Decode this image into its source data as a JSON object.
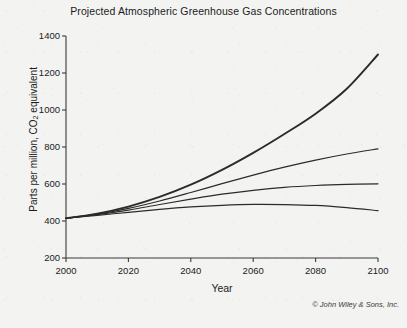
{
  "chart_data": {
    "type": "line",
    "title": "Projected Atmospheric Greenhouse Gas Concentrations",
    "xlabel": "Year",
    "ylabel": "Parts per million, CO2 equivalent",
    "ylabel_prefix": "Parts per million, CO",
    "ylabel_subscript": "2",
    "ylabel_suffix": " equivalent",
    "xlim": [
      2000,
      2100
    ],
    "ylim": [
      200,
      1400
    ],
    "xticks": [
      2000,
      2020,
      2040,
      2060,
      2080,
      2100
    ],
    "xtick_labels": [
      "2000",
      "2020",
      "2040",
      "2060",
      "2080",
      "2100"
    ],
    "yticks": [
      200,
      400,
      600,
      800,
      1000,
      1200,
      1400
    ],
    "ytick_labels": [
      "200",
      "400",
      "600",
      "800",
      "1000",
      "1200",
      "1400"
    ],
    "grid": false,
    "legend": "none",
    "line_color": "#2b2b2b",
    "axis_color": "#3a3a3a",
    "background_color": "#f3f3f2",
    "x": [
      2000,
      2010,
      2020,
      2030,
      2040,
      2050,
      2060,
      2070,
      2080,
      2090,
      2100
    ],
    "series": [
      {
        "name": "highest-emissions-scenario",
        "values": [
          415,
          440,
          478,
          530,
          596,
          676,
          768,
          870,
          980,
          1115,
          1300
        ],
        "line_width": 1.9,
        "end_value": 1300
      },
      {
        "name": "high-emissions-scenario",
        "values": [
          415,
          437,
          468,
          508,
          554,
          602,
          648,
          691,
          729,
          762,
          790
        ],
        "line_width": 1.2,
        "end_value": 790
      },
      {
        "name": "moderate-emissions-scenario",
        "values": [
          415,
          434,
          459,
          489,
          518,
          545,
          566,
          582,
          592,
          598,
          601
        ],
        "line_width": 1.2,
        "end_value": 601
      },
      {
        "name": "low-emissions-scenario",
        "values": [
          415,
          430,
          447,
          463,
          476,
          485,
          490,
          489,
          484,
          472,
          456
        ],
        "line_width": 1.2,
        "end_value": 456
      }
    ],
    "copyright": "© John Wiley & Sons, Inc."
  }
}
